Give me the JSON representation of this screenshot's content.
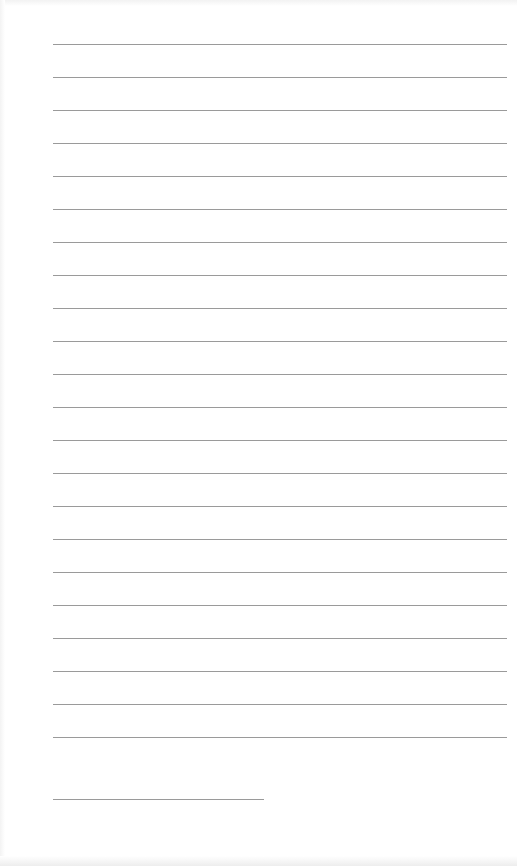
{
  "document": {
    "type": "lined-writing-page",
    "background_color": "#ffffff",
    "line_color": "#9a9a9a",
    "full_lines": {
      "count": 22,
      "first_y": 44,
      "spacing": 33,
      "x_start": 53,
      "x_end": 507
    },
    "signature_line": {
      "y": 799,
      "x_start": 53,
      "x_end": 264
    }
  }
}
